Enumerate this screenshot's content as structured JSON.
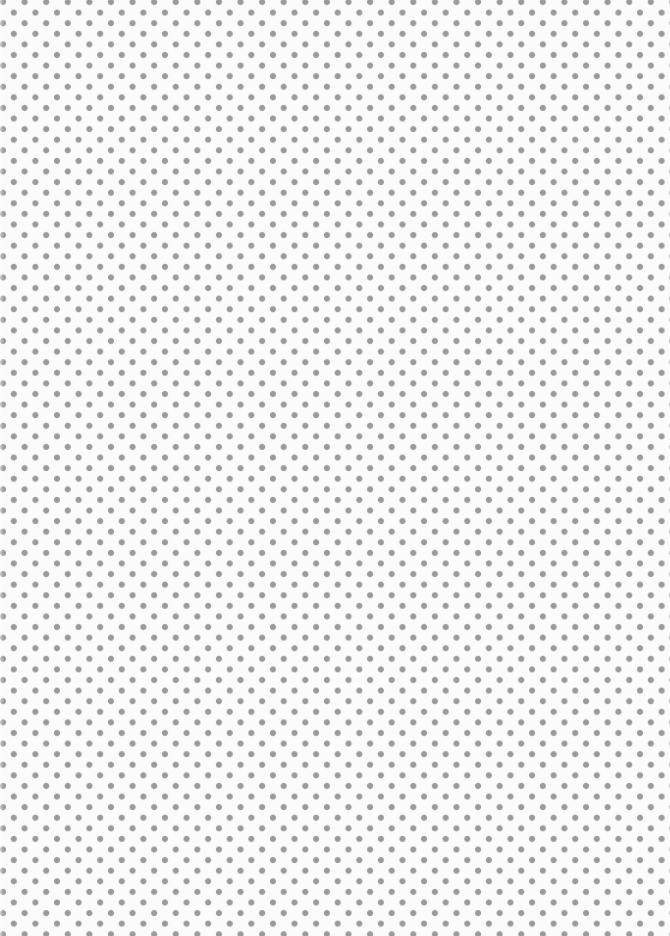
{
  "image": {
    "description": "Seamless polka-dot texture: staggered grid of gray dots on white",
    "background_color": "#fbfbfb",
    "dot_color": "#9a9a9a",
    "dot_diameter_px": 6,
    "horizontal_period_px": 21.6,
    "vertical_period_px": 21.2,
    "stagger": "alternate rows offset by half period"
  }
}
